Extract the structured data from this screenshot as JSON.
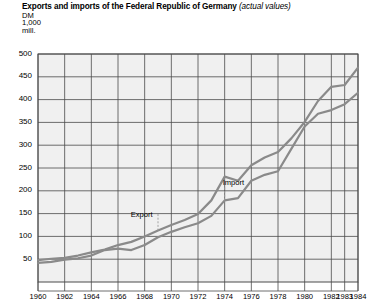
{
  "header": {
    "title_main": "Exports and imports of the Federal Republic of Germany",
    "title_sub": "(actual values)",
    "unit_line1": "DM",
    "unit_line2": "1,000",
    "unit_line3": "mill."
  },
  "colors": {
    "line": "#8a8a8a",
    "grid": "#4a4a4a",
    "plot_bg": "#f0f0f0",
    "text": "#000000",
    "page_bg": "#ffffff"
  },
  "chart_data": {
    "type": "line",
    "title": "Exports and imports of the Federal Republic of Germany (actual values)",
    "subtitle": "(actual values)",
    "xlabel": "",
    "ylabel": "DM 1,000 mill.",
    "ylim": [
      0,
      500
    ],
    "yticks": [
      50,
      100,
      150,
      200,
      250,
      300,
      350,
      400,
      450,
      500
    ],
    "ytick_labels": [
      "50",
      "100",
      "150",
      "200",
      "250",
      "300",
      "350",
      "400",
      "450",
      "500"
    ],
    "x": [
      1960,
      1961,
      1962,
      1963,
      1964,
      1965,
      1966,
      1967,
      1968,
      1969,
      1970,
      1971,
      1972,
      1973,
      1974,
      1975,
      1976,
      1977,
      1978,
      1979,
      1980,
      1981,
      1982,
      1983,
      1984
    ],
    "xtick_labels": [
      "1960",
      "1962",
      "1964",
      "1966",
      "1968",
      "1970",
      "1972",
      "1974",
      "1976",
      "1978",
      "1980",
      "1982",
      "1983",
      "1984"
    ],
    "xticks": [
      1960,
      1962,
      1964,
      1966,
      1968,
      1970,
      1972,
      1974,
      1976,
      1978,
      1980,
      1982,
      1983,
      1984
    ],
    "grid": true,
    "legend_position": "inline-annotation",
    "series": [
      {
        "name": "Export",
        "values": [
          48,
          51,
          53,
          58,
          65,
          71,
          81,
          88,
          100,
          113,
          125,
          136,
          149,
          179,
          231,
          222,
          256,
          273,
          285,
          315,
          351,
          397,
          428,
          432,
          470
        ]
      },
      {
        "name": "Import",
        "values": [
          42,
          44,
          49,
          52,
          58,
          70,
          73,
          70,
          81,
          98,
          110,
          120,
          129,
          145,
          179,
          184,
          222,
          235,
          243,
          292,
          341,
          369,
          377,
          390,
          415
        ]
      }
    ],
    "annotations": [
      {
        "label": "Export",
        "series": "Export"
      },
      {
        "label": "Import",
        "series": "Import"
      }
    ]
  }
}
